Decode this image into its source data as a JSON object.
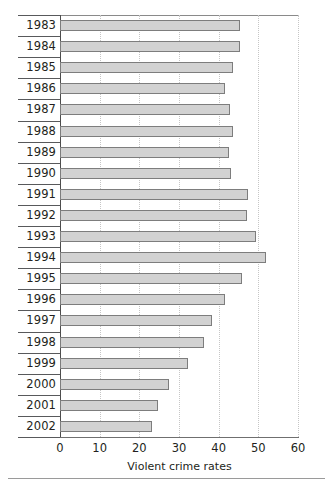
{
  "chart_data": {
    "type": "bar",
    "orientation": "horizontal",
    "title": "",
    "xlabel": "Violent crime rates",
    "ylabel": "",
    "xlim": [
      0,
      60
    ],
    "xticks": [
      0,
      10,
      20,
      30,
      40,
      50,
      60
    ],
    "grid": "vertical-dotted",
    "legend": "none",
    "categories": [
      "1983",
      "1984",
      "1985",
      "1986",
      "1987",
      "1988",
      "1989",
      "1990",
      "1991",
      "1992",
      "1993",
      "1994",
      "1995",
      "1996",
      "1997",
      "1998",
      "1999",
      "2000",
      "2001",
      "2002"
    ],
    "values": [
      45.5,
      45.5,
      43.5,
      41.5,
      42.9,
      43.5,
      42.5,
      43.2,
      47.5,
      47.2,
      49.5,
      52.0,
      46.0,
      41.5,
      38.2,
      36.2,
      32.2,
      27.4,
      24.7,
      23.1
    ],
    "colors": {
      "bar_fill": "#d2d2d2",
      "bar_stroke": "#7d7d7d",
      "grid": "#c6c6c6",
      "axis": "#4d4d4d",
      "text": "#231f20",
      "background": "#ffffff"
    }
  }
}
